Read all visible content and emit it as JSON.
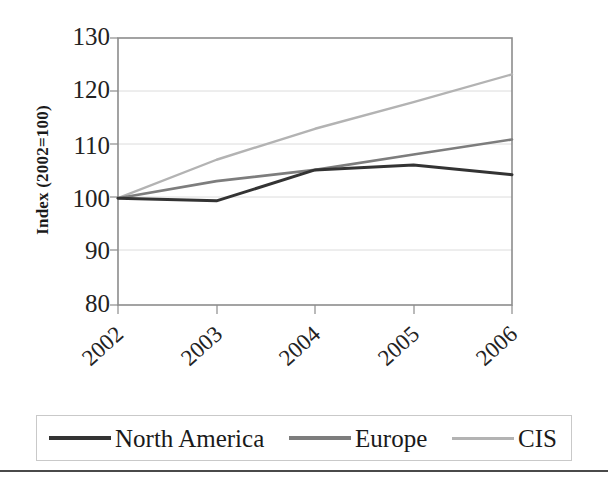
{
  "chart_data": {
    "type": "line",
    "title": "",
    "subtitle": "",
    "xlabel": "",
    "ylabel": "Index (2002=100)",
    "categories": [
      "2002",
      "2003",
      "2004",
      "2005",
      "2006"
    ],
    "ylim": [
      80,
      130
    ],
    "yticks": [
      80,
      90,
      100,
      110,
      120,
      130
    ],
    "ytick_labels": [
      "80",
      "90",
      "100",
      "110",
      "120",
      "130"
    ],
    "grid": "horizontal",
    "legend_position": "bottom",
    "series": [
      {
        "name": "North America",
        "color": "#333333",
        "values": [
          100,
          99.5,
          105.3,
          106.2,
          104.4
        ]
      },
      {
        "name": "Europe",
        "color": "#7d7d7d",
        "values": [
          100,
          103.2,
          105.3,
          108.2,
          111.0
        ]
      },
      {
        "name": "CIS",
        "color": "#b3b3b3",
        "values": [
          100,
          107.2,
          113.0,
          118.0,
          123.2
        ]
      }
    ]
  },
  "axes": {
    "y_title": "Index (2002=100)",
    "y_tick_0": "80",
    "y_tick_1": "90",
    "y_tick_2": "100",
    "y_tick_3": "110",
    "y_tick_4": "120",
    "y_tick_5": "130",
    "x_tick_0": "2002",
    "x_tick_1": "2003",
    "x_tick_2": "2004",
    "x_tick_3": "2005",
    "x_tick_4": "2006"
  },
  "legend": {
    "entries": [
      {
        "label": "North America",
        "color": "#333333"
      },
      {
        "label": "Europe",
        "color": "#7d7d7d"
      },
      {
        "label": "CIS",
        "color": "#b3b3b3"
      }
    ],
    "entry_0_label": "North America",
    "entry_1_label": "Europe",
    "entry_2_label": "CIS"
  },
  "style": {
    "plot_border_color": "#8c8c8c",
    "gridline_color": "#d9d9d9",
    "axis_text_color": "#222222",
    "legend_border_color": "#c9c9c9",
    "rule_color": "#4a4a4a"
  }
}
